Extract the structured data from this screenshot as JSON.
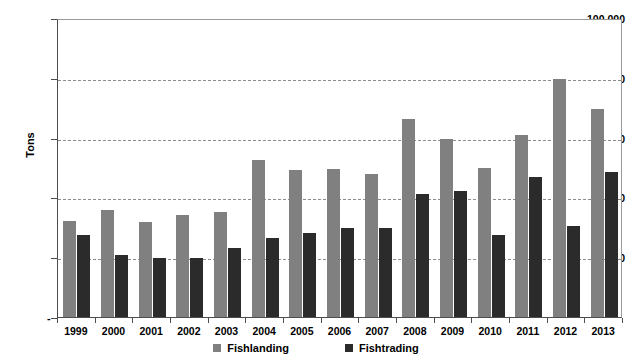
{
  "chart_data": {
    "type": "bar",
    "title": "",
    "xlabel": "",
    "ylabel": "Tons",
    "ylim": [
      0,
      100000
    ],
    "grid": true,
    "legend_position": "bottom",
    "ytick_labels": [
      "100,000",
      "80,000",
      "60,000",
      "40,000",
      "20,000",
      "-"
    ],
    "ytick_values": [
      100000,
      80000,
      60000,
      40000,
      20000,
      0
    ],
    "categories": [
      "1999",
      "2000",
      "2001",
      "2002",
      "2003",
      "2004",
      "2005",
      "2006",
      "2007",
      "2008",
      "2009",
      "2010",
      "2011",
      "2012",
      "2013"
    ],
    "series": [
      {
        "name": "Fishlanding",
        "color": "#808080",
        "values": [
          32000,
          35700,
          31700,
          34200,
          35200,
          52500,
          49300,
          49600,
          47700,
          66200,
          59500,
          50000,
          60800,
          79700,
          69500
        ]
      },
      {
        "name": "Fishtrading",
        "color": "#2b2b2b",
        "values": [
          27300,
          20800,
          19900,
          19900,
          23100,
          26500,
          28100,
          29800,
          29700,
          41000,
          42300,
          27500,
          46700,
          30300,
          48400
        ]
      }
    ]
  },
  "legend": {
    "items": [
      {
        "label": "Fishlanding",
        "color": "#808080"
      },
      {
        "label": "Fishtrading",
        "color": "#2b2b2b"
      }
    ]
  },
  "axis": {
    "y_title": "Tons",
    "zero_marker": "-"
  }
}
